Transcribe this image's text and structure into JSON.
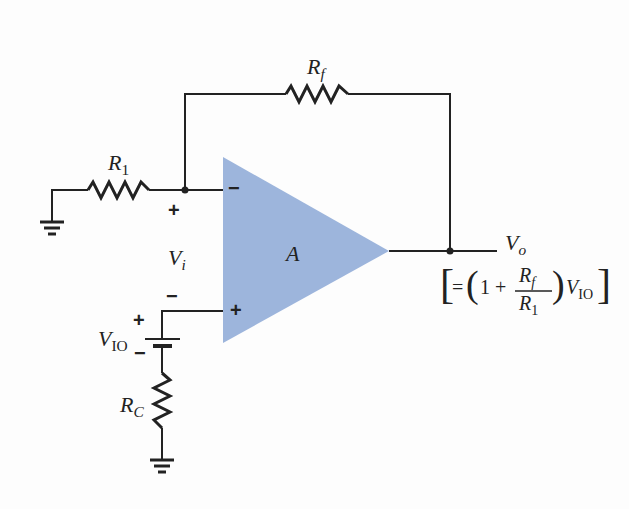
{
  "diagram": {
    "type": "op-amp offset voltage circuit",
    "colors": {
      "opamp_fill": "#9db5dc",
      "wire": "#222222",
      "background": "#fdfdfd"
    },
    "components": {
      "feedback_resistor": {
        "label_main": "R",
        "label_sub": "f"
      },
      "input_resistor": {
        "label_main": "R",
        "label_sub": "1"
      },
      "compensation_resistor": {
        "label_main": "R",
        "label_sub": "C"
      },
      "offset_source": {
        "label_main": "V",
        "label_sub": "IO"
      },
      "opamp": {
        "label": "A",
        "inverting_sign": "−",
        "noninverting_sign": "+"
      },
      "input_voltage": {
        "label_main": "V",
        "label_sub": "i",
        "plus": "+",
        "minus": "−"
      },
      "output": {
        "label_main": "V",
        "label_sub": "o"
      }
    },
    "equation": {
      "open": "[",
      "eq": "=",
      "lparen": "(",
      "one": "1 +",
      "num_main": "R",
      "num_sub": "f",
      "den_main": "R",
      "den_sub": "1",
      "rparen": ")",
      "v_main": "V",
      "v_sub": "IO",
      "close": "]"
    },
    "battery_signs": {
      "plus": "+",
      "minus": "−"
    }
  }
}
